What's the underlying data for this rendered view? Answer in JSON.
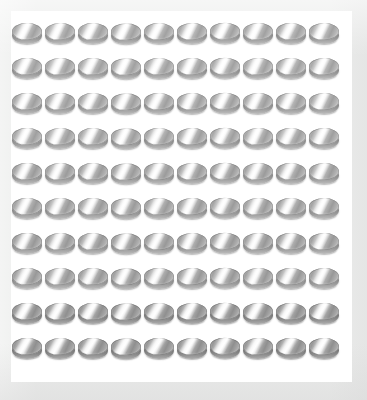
{
  "scene": {
    "title": "Array of identical metallic disc objects",
    "background_color": "#ebeceb",
    "board_color": "#ffffff",
    "object_name": "metallic-disc",
    "object_description": "silver-gray disc viewed at a low oblique angle with a diagonal specular highlight",
    "rows": 10,
    "columns": 10,
    "total_count": 100,
    "arrangement": "regular-grid",
    "object_colors": {
      "highlight": "#fbfbfb",
      "midtone": "#b3b3b3",
      "shadow": "#7d7d7d",
      "rim": "#8d8d8d"
    },
    "row_labels": [
      "row-1",
      "row-2",
      "row-3",
      "row-4",
      "row-5",
      "row-6",
      "row-7",
      "row-8",
      "row-9",
      "row-10"
    ],
    "column_labels": [
      "col-1",
      "col-2",
      "col-3",
      "col-4",
      "col-5",
      "col-6",
      "col-7",
      "col-8",
      "col-9",
      "col-10"
    ]
  }
}
